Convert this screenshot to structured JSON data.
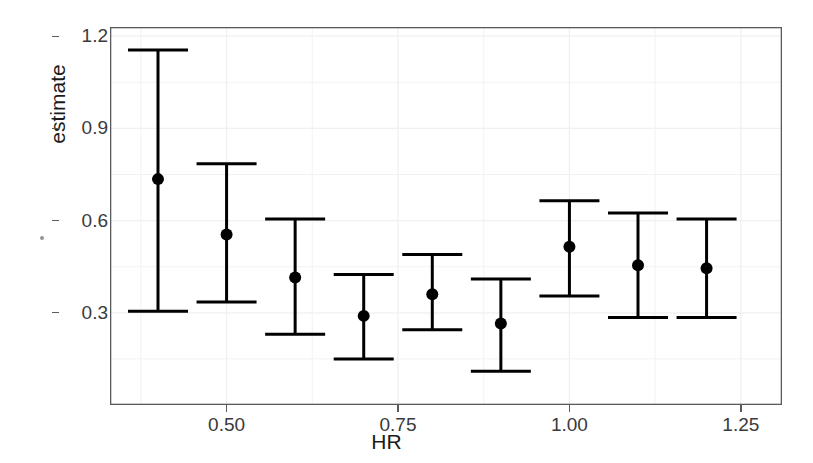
{
  "chart_data": {
    "type": "scatter",
    "title": "",
    "xlabel": "HR",
    "ylabel": "estimate",
    "xlim": [
      0.33,
      1.31
    ],
    "ylim": [
      0.0,
      1.23
    ],
    "xticks": [
      "0.50",
      "0.75",
      "1.00",
      "1.25"
    ],
    "xtick_values": [
      0.5,
      0.75,
      1.0,
      1.25
    ],
    "yticks": [
      "0.3",
      "0.6",
      "0.9",
      "1.2"
    ],
    "ytick_values": [
      0.3,
      0.6,
      0.9,
      1.2
    ],
    "grid": true,
    "legend": "none",
    "marker": "filled-circle",
    "errorbar_style": "capped-vertical",
    "series": [
      {
        "name": "estimate",
        "x": [
          0.4,
          0.5,
          0.6,
          0.7,
          0.8,
          0.9,
          1.0,
          1.1,
          1.2
        ],
        "values": [
          0.735,
          0.555,
          0.415,
          0.29,
          0.36,
          0.265,
          0.515,
          0.455,
          0.445
        ],
        "low": [
          0.305,
          0.335,
          0.23,
          0.15,
          0.245,
          0.11,
          0.355,
          0.285,
          0.285
        ],
        "high": [
          1.155,
          0.785,
          0.605,
          0.425,
          0.49,
          0.41,
          0.665,
          0.625,
          0.605
        ]
      }
    ]
  },
  "axes": {
    "y_title": "estimate",
    "x_title": "HR"
  },
  "colors": {
    "marker": "#000000",
    "errorbar": "#000000",
    "axis": "#555555",
    "grid": "#f0f0f0",
    "tick_text": "#3a3a3a",
    "background": "#ffffff"
  }
}
